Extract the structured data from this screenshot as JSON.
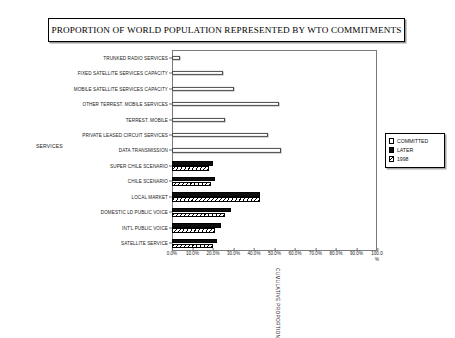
{
  "chart": {
    "title": "PROPORTION OF WORLD POPULATION REPRESENTED BY WTO COMMITMENTS",
    "y_axis_group_label": "SERVICES",
    "x_axis_title": "CUMULATIVE PROPORTION"
  },
  "legend": {
    "items": [
      {
        "label": "COMMITTED",
        "swatch": "white-square"
      },
      {
        "label": "LATER",
        "swatch": "black-square"
      },
      {
        "label": "1998",
        "swatch": "hatched-square"
      }
    ]
  },
  "chart_data": {
    "type": "bar",
    "orientation": "horizontal",
    "title": "PROPORTION OF WORLD POPULATION REPRESENTED BY WTO COMMITMENTS",
    "xlabel": "CUMULATIVE PROPORTION",
    "ylabel": "SERVICES",
    "xlim": [
      0,
      100
    ],
    "xticks": [
      0,
      10,
      20,
      30,
      40,
      50,
      60,
      70,
      80,
      90,
      100
    ],
    "xticklabels": [
      "0.0%",
      "10.0%",
      "20.0%",
      "30.0%",
      "40.0%",
      "50.0%",
      "60.0%",
      "70.0%",
      "80.0%",
      "90.0%",
      "100.0\n%"
    ],
    "grid": false,
    "legend_position": "right",
    "categories": [
      "TRUNKED RADIO SERVICES",
      "FIXED SATELLITE SERVICES CAPACITY",
      "MOBILE SATELLITE SERVICES CAPACITY",
      "OTHER TERREST. MOBILE SERVICES",
      "TERREST. MOBILE",
      "PRIVATE LEASED CIRCUIT SERVICES",
      "DATA TRANSMISSION",
      "SUPER CHILE SCENARIO",
      "CHILE SCENARIO",
      "LOCAL MARKET",
      "DOMESTIC LD PUBLIC VOICE",
      "INT'L PUBLIC VOICE",
      "SATELLITE SERVICE"
    ],
    "series": [
      {
        "name": "COMMITTED",
        "values": [
          4.0,
          25.0,
          30.0,
          52.0,
          26.0,
          47.0,
          53.0,
          null,
          null,
          null,
          null,
          null,
          null
        ]
      },
      {
        "name": "LATER",
        "values": [
          null,
          null,
          null,
          null,
          null,
          null,
          null,
          20.0,
          21.0,
          43.0,
          29.0,
          24.0,
          22.0
        ]
      },
      {
        "name": "1998",
        "values": [
          null,
          null,
          null,
          null,
          null,
          null,
          null,
          18.0,
          19.0,
          43.0,
          26.0,
          21.0,
          20.0
        ]
      }
    ]
  }
}
